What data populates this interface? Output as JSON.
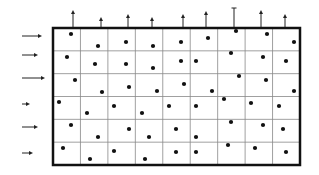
{
  "diagram": {
    "colors": {
      "background": "#ffffff",
      "border": "#111111",
      "grid_line": "#888888",
      "dot": "#111111",
      "arrow": "#222222"
    },
    "grid": {
      "x0": 53,
      "y0": 28,
      "x1": 300,
      "y1": 165,
      "cols": 9,
      "rows": 6,
      "border_width": 2.5,
      "line_width": 0.8
    },
    "left_arrows": [
      {
        "y": 36,
        "x_start": 22,
        "x_end": 42
      },
      {
        "y": 55,
        "x_start": 22,
        "x_end": 38
      },
      {
        "y": 78,
        "x_start": 22,
        "x_end": 45
      },
      {
        "y": 104,
        "x_start": 22,
        "x_end": 30
      },
      {
        "y": 127,
        "x_start": 22,
        "x_end": 38
      },
      {
        "y": 153,
        "x_start": 22,
        "x_end": 33
      }
    ],
    "top_arrows": [
      {
        "x": 73,
        "y_top": 10,
        "type": "arrow"
      },
      {
        "x": 101,
        "y_top": 17,
        "type": "arrow"
      },
      {
        "x": 128,
        "y_top": 14,
        "type": "arrow"
      },
      {
        "x": 152,
        "y_top": 17,
        "type": "arrow"
      },
      {
        "x": 183,
        "y_top": 14,
        "type": "arrow"
      },
      {
        "x": 206,
        "y_top": 11,
        "type": "arrow"
      },
      {
        "x": 234,
        "y_top": 8,
        "type": "tick"
      },
      {
        "x": 261,
        "y_top": 10,
        "type": "arrow"
      },
      {
        "x": 285,
        "y_top": 14,
        "type": "arrow"
      }
    ],
    "dots": [
      [
        71,
        34
      ],
      [
        98,
        46
      ],
      [
        126,
        42
      ],
      [
        153,
        46
      ],
      [
        181,
        42
      ],
      [
        208,
        38
      ],
      [
        236,
        31
      ],
      [
        267,
        34
      ],
      [
        294,
        42
      ],
      [
        67,
        57
      ],
      [
        95,
        64
      ],
      [
        126,
        64
      ],
      [
        153,
        68
      ],
      [
        181,
        61
      ],
      [
        196,
        61
      ],
      [
        231,
        53
      ],
      [
        263,
        57
      ],
      [
        286,
        61
      ],
      [
        75,
        80
      ],
      [
        102,
        92
      ],
      [
        129,
        87
      ],
      [
        157,
        91
      ],
      [
        184,
        84
      ],
      [
        212,
        91
      ],
      [
        239,
        76
      ],
      [
        266,
        80
      ],
      [
        294,
        91
      ],
      [
        59,
        102
      ],
      [
        87,
        113
      ],
      [
        114,
        106
      ],
      [
        142,
        113
      ],
      [
        169,
        106
      ],
      [
        196,
        106
      ],
      [
        224,
        99
      ],
      [
        251,
        103
      ],
      [
        279,
        106
      ],
      [
        71,
        125
      ],
      [
        98,
        137
      ],
      [
        129,
        129
      ],
      [
        149,
        137
      ],
      [
        176,
        129
      ],
      [
        196,
        137
      ],
      [
        231,
        122
      ],
      [
        263,
        125
      ],
      [
        283,
        129
      ],
      [
        63,
        148
      ],
      [
        90,
        159
      ],
      [
        114,
        151
      ],
      [
        145,
        159
      ],
      [
        176,
        152
      ],
      [
        196,
        152
      ],
      [
        228,
        145
      ],
      [
        255,
        148
      ],
      [
        286,
        152
      ]
    ],
    "dot_radius": 2.1
  }
}
